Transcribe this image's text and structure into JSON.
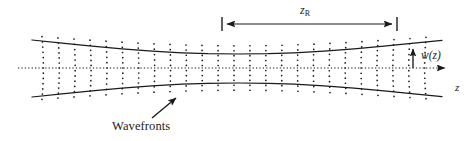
{
  "figure": {
    "background_color": "#ffffff",
    "ink_color": "#1a1a1a",
    "width": 476,
    "height": 141
  },
  "labels": {
    "rayleigh_range": "z",
    "rayleigh_range_subscript": "R",
    "beam_radius": "w(z)",
    "propagation_axis": "z",
    "wavefronts": "Wavefronts"
  },
  "chart_data": {
    "type": "line",
    "xlabel": "z",
    "ylabel": "w(z)",
    "grid": false,
    "legend_position": "none",
    "annotations": [
      {
        "name": "rayleigh-range-bar",
        "text": "z_R",
        "x_start": 222,
        "x_end": 397,
        "y": 24,
        "style": "double-arrow"
      },
      {
        "name": "beam-radius-arrow",
        "text": "w(z)",
        "x": 413,
        "y_start": 68,
        "y_end": 44,
        "style": "single-arrow-up"
      },
      {
        "name": "wavefronts-pointer",
        "text": "Wavefronts",
        "x_start": 152,
        "y_start": 118,
        "x_end": 178,
        "y_end": 96,
        "style": "single-arrow"
      }
    ],
    "axis": {
      "name": "optical-axis",
      "style": "dotted",
      "x_start": 18,
      "x_end": 452,
      "y": 68,
      "arrow_end": "right"
    },
    "envelope": {
      "waist_x": 238,
      "waist_half_width": 14,
      "rayleigh_length": 175,
      "divergence_half_width_at_edge": 30,
      "x_start": 32,
      "x_end": 442,
      "upper_y_at_start": 40,
      "upper_y_at_waist": 54,
      "upper_y_at_end": 40,
      "lower_y_at_start": 97,
      "lower_y_at_waist": 82,
      "lower_y_at_end": 97
    },
    "wavefronts": {
      "style": "dotted-arcs",
      "count": 25,
      "spacing_px": 16,
      "x_first": 42,
      "curvature_note": "concave toward waist; flat at waist; curvature sign flips across waist",
      "dot_radius_px": 0.85,
      "dot_spacing_px": 5.2
    },
    "series": [
      {
        "name": "upper-envelope",
        "x": [
          32,
          62,
          92,
          122,
          152,
          182,
          208,
          238,
          268,
          294,
          324,
          354,
          384,
          414,
          442
        ],
        "y": [
          40.0,
          43.2,
          46.2,
          48.9,
          51.1,
          52.8,
          53.7,
          54.0,
          53.7,
          52.8,
          51.1,
          48.9,
          46.2,
          43.2,
          40.4
        ]
      },
      {
        "name": "lower-envelope",
        "x": [
          32,
          62,
          92,
          122,
          152,
          182,
          208,
          238,
          268,
          294,
          324,
          354,
          384,
          414,
          442
        ],
        "y": [
          97.0,
          93.8,
          90.8,
          88.1,
          85.9,
          84.2,
          83.3,
          83.0,
          83.3,
          84.2,
          85.9,
          88.1,
          90.8,
          93.8,
          96.6
        ]
      }
    ],
    "xlim": [
      0,
      476
    ],
    "ylim": [
      141,
      0
    ]
  }
}
